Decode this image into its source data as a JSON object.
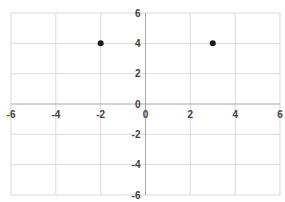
{
  "chart_data": {
    "type": "scatter",
    "title": "",
    "xlabel": "",
    "ylabel": "",
    "xlim": [
      -6,
      6
    ],
    "ylim": [
      -6,
      6
    ],
    "x_ticks": [
      -6,
      -4,
      -2,
      0,
      2,
      4,
      6
    ],
    "y_ticks": [
      -6,
      -4,
      -2,
      0,
      2,
      4,
      6
    ],
    "grid": true,
    "legend": null,
    "series": [
      {
        "name": "Series 1",
        "points": [
          {
            "x": -2,
            "y": 4
          },
          {
            "x": 3,
            "y": 4
          }
        ],
        "color": "#1a1a1a"
      }
    ]
  },
  "style": {
    "grid_color": "#d9d9d9",
    "axis_color": "#a6a6a6",
    "label_color": "#404040",
    "marker_color": "#1a1a1a"
  }
}
